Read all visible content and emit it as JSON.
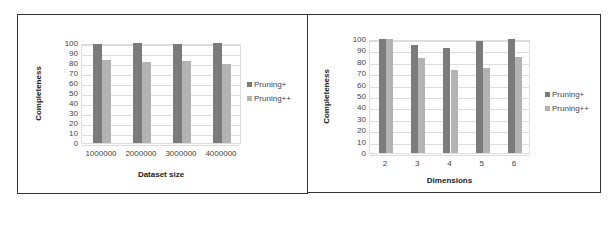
{
  "colors": {
    "series1": "#7b7b7b",
    "series2": "#b3b3b3"
  },
  "chart_data": [
    {
      "type": "bar",
      "title": "",
      "xlabel": "Dataset size",
      "ylabel": "Completeness",
      "ylim": [
        0,
        100
      ],
      "yticks": [
        0,
        10,
        20,
        30,
        40,
        50,
        60,
        70,
        80,
        90,
        100
      ],
      "categories": [
        "1000000",
        "2000000",
        "3000000",
        "4000000"
      ],
      "series": [
        {
          "name": "Pruning+",
          "values": [
            99,
            100,
            99,
            100
          ]
        },
        {
          "name": "Pruning++",
          "values": [
            83,
            81,
            82,
            79
          ]
        }
      ],
      "legend_position": "right",
      "grid": true
    },
    {
      "type": "bar",
      "title": "",
      "xlabel": "Dimensions",
      "ylabel": "Completeness",
      "ylim": [
        0,
        100
      ],
      "yticks": [
        0,
        10,
        20,
        30,
        40,
        50,
        60,
        70,
        80,
        90,
        100
      ],
      "categories": [
        "2",
        "3",
        "4",
        "5",
        "6"
      ],
      "series": [
        {
          "name": "Pruning+",
          "values": [
            100,
            95,
            92,
            98,
            100
          ]
        },
        {
          "name": "Pruning++",
          "values": [
            100,
            83,
            73,
            75,
            84
          ]
        }
      ],
      "legend_position": "right",
      "grid": true
    }
  ]
}
